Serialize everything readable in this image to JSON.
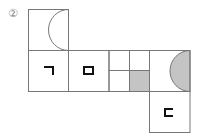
{
  "problem": {
    "number_label": "②"
  },
  "net": {
    "description": "Cube net with 6 faces",
    "colors": {
      "line": "#777777",
      "shade": "#c4c4c4",
      "mark": "#111111"
    },
    "faces": [
      {
        "id": "top",
        "content": "half-circle outline on right edge"
      },
      {
        "id": "left",
        "content": "ㄱ"
      },
      {
        "id": "center-left",
        "content": "ㅁ"
      },
      {
        "id": "center",
        "content": "four quadrants, bottom-right shaded"
      },
      {
        "id": "right",
        "content": "shaded half-circle on right edge"
      },
      {
        "id": "bottom",
        "content": "ㄷ"
      }
    ],
    "glyphs": {
      "giyeok": "ㄱ",
      "mieum": "ㅁ",
      "digeut": "ㄷ"
    }
  }
}
